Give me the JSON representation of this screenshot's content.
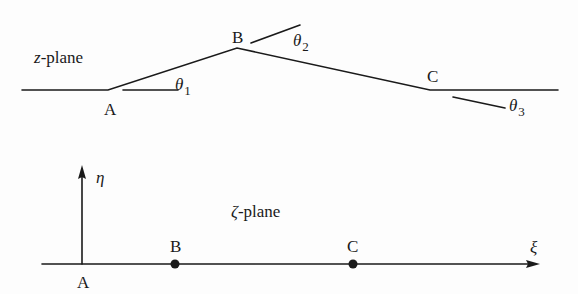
{
  "top_diagram": {
    "plane_label": "z-plane",
    "plane_var": "z",
    "plane_suffix": "-plane",
    "points": [
      {
        "label": "A",
        "x": 108,
        "y": 90
      },
      {
        "label": "B",
        "x": 237,
        "y": 48
      },
      {
        "label": "C",
        "x": 430,
        "y": 90
      }
    ],
    "angles": [
      {
        "symbol": "θ",
        "index": "1"
      },
      {
        "symbol": "θ",
        "index": "2"
      },
      {
        "symbol": "θ",
        "index": "3"
      }
    ]
  },
  "bottom_diagram": {
    "plane_label": "ζ-plane",
    "plane_var": "ζ",
    "plane_suffix": "-plane",
    "x_axis_label": "ξ",
    "y_axis_label": "η",
    "points": [
      {
        "label": "A",
        "x": 82,
        "marker": false
      },
      {
        "label": "B",
        "x": 175,
        "marker": true
      },
      {
        "label": "C",
        "x": 353,
        "marker": true
      }
    ]
  },
  "colors": {
    "stroke": "#1a1a1a",
    "background": "#fdfdfd"
  }
}
